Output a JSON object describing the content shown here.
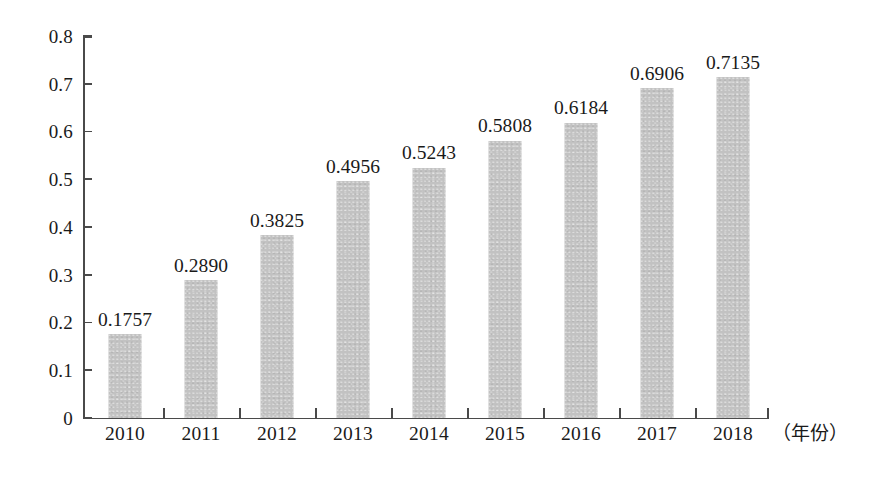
{
  "chart_data": {
    "type": "bar",
    "title": "",
    "subtitle": "",
    "xlabel": "（年份）",
    "ylabel": "",
    "categories": [
      "2010",
      "2011",
      "2012",
      "2013",
      "2014",
      "2015",
      "2016",
      "2017",
      "2018"
    ],
    "values": [
      0.1757,
      0.289,
      0.3825,
      0.4956,
      0.5243,
      0.5808,
      0.6184,
      0.6906,
      0.7135
    ],
    "value_labels": [
      "0.1757",
      "0.2890",
      "0.3825",
      "0.4956",
      "0.5243",
      "0.5808",
      "0.6184",
      "0.6906",
      "0.7135"
    ],
    "ylim": [
      0,
      0.8
    ],
    "y_ticks": [
      0,
      0.1,
      0.2,
      0.3,
      0.4,
      0.5,
      0.6,
      0.7,
      0.8
    ],
    "y_tick_labels": [
      "0",
      "0.1",
      "0.2",
      "0.3",
      "0.4",
      "0.5",
      "0.6",
      "0.7",
      "0.8"
    ],
    "grid": false,
    "legend": null,
    "legend_position": "none",
    "bar_color": "#c2c2c2",
    "axis_color": "#4a4a4a",
    "text_color": "#1a1a1a",
    "data_labels_shown": true,
    "series": [
      {
        "name": "",
        "values": [
          0.1757,
          0.289,
          0.3825,
          0.4956,
          0.5243,
          0.5808,
          0.6184,
          0.6906,
          0.7135
        ]
      }
    ]
  }
}
